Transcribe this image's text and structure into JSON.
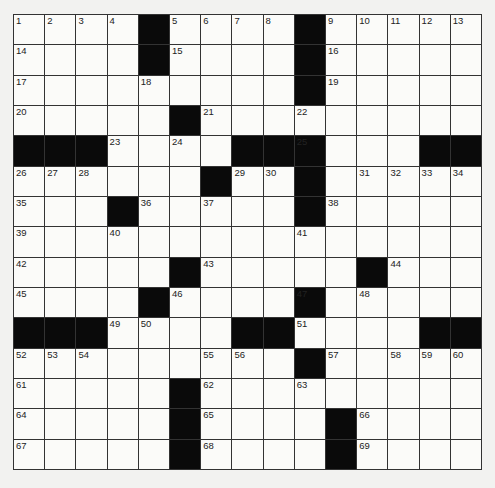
{
  "puzzle": {
    "rows": 15,
    "cols": 15,
    "colors": {
      "block": "#0a0a0a",
      "cell": "#fbfbf9",
      "line": "#333333"
    },
    "grid": [
      "....#....#.....",
      "....#....#.....",
      ".........#.....",
      ".....#.........",
      "###....###...##",
      "......#..#.....",
      "...#.....#.....",
      "...............",
      ".....#.....#...",
      "....#....#.....",
      "###....##....##",
      ".........#.....",
      ".....#.........",
      ".....#....#....",
      ".....#....#...."
    ],
    "numbers": [
      {
        "r": 0,
        "c": 0,
        "n": 1
      },
      {
        "r": 0,
        "c": 1,
        "n": 2
      },
      {
        "r": 0,
        "c": 2,
        "n": 3
      },
      {
        "r": 0,
        "c": 3,
        "n": 4
      },
      {
        "r": 0,
        "c": 5,
        "n": 5
      },
      {
        "r": 0,
        "c": 6,
        "n": 6
      },
      {
        "r": 0,
        "c": 7,
        "n": 7
      },
      {
        "r": 0,
        "c": 8,
        "n": 8
      },
      {
        "r": 0,
        "c": 10,
        "n": 9
      },
      {
        "r": 0,
        "c": 11,
        "n": 10
      },
      {
        "r": 0,
        "c": 12,
        "n": 11
      },
      {
        "r": 0,
        "c": 13,
        "n": 12
      },
      {
        "r": 0,
        "c": 14,
        "n": 13
      },
      {
        "r": 1,
        "c": 0,
        "n": 14
      },
      {
        "r": 1,
        "c": 5,
        "n": 15
      },
      {
        "r": 1,
        "c": 10,
        "n": 16
      },
      {
        "r": 2,
        "c": 0,
        "n": 17
      },
      {
        "r": 2,
        "c": 4,
        "n": 18
      },
      {
        "r": 2,
        "c": 10,
        "n": 19
      },
      {
        "r": 3,
        "c": 0,
        "n": 20
      },
      {
        "r": 3,
        "c": 6,
        "n": 21
      },
      {
        "r": 3,
        "c": 9,
        "n": 22
      },
      {
        "r": 4,
        "c": 3,
        "n": 23
      },
      {
        "r": 4,
        "c": 5,
        "n": 24
      },
      {
        "r": 4,
        "c": 9,
        "n": 25
      },
      {
        "r": 5,
        "c": 0,
        "n": 26
      },
      {
        "r": 5,
        "c": 1,
        "n": 27
      },
      {
        "r": 5,
        "c": 2,
        "n": 28
      },
      {
        "r": 5,
        "c": 7,
        "n": 29
      },
      {
        "r": 5,
        "c": 8,
        "n": 30
      },
      {
        "r": 5,
        "c": 11,
        "n": 31
      },
      {
        "r": 5,
        "c": 12,
        "n": 32
      },
      {
        "r": 5,
        "c": 13,
        "n": 33
      },
      {
        "r": 5,
        "c": 14,
        "n": 34
      },
      {
        "r": 6,
        "c": 0,
        "n": 35
      },
      {
        "r": 6,
        "c": 4,
        "n": 36
      },
      {
        "r": 6,
        "c": 6,
        "n": 37
      },
      {
        "r": 6,
        "c": 10,
        "n": 38
      },
      {
        "r": 7,
        "c": 0,
        "n": 39
      },
      {
        "r": 7,
        "c": 3,
        "n": 40
      },
      {
        "r": 7,
        "c": 9,
        "n": 41
      },
      {
        "r": 8,
        "c": 0,
        "n": 42
      },
      {
        "r": 8,
        "c": 6,
        "n": 43
      },
      {
        "r": 8,
        "c": 12,
        "n": 44
      },
      {
        "r": 9,
        "c": 0,
        "n": 45
      },
      {
        "r": 9,
        "c": 5,
        "n": 46
      },
      {
        "r": 9,
        "c": 9,
        "n": 47
      },
      {
        "r": 9,
        "c": 11,
        "n": 48
      },
      {
        "r": 10,
        "c": 3,
        "n": 49
      },
      {
        "r": 10,
        "c": 4,
        "n": 50
      },
      {
        "r": 10,
        "c": 9,
        "n": 51
      },
      {
        "r": 11,
        "c": 0,
        "n": 52
      },
      {
        "r": 11,
        "c": 1,
        "n": 53
      },
      {
        "r": 11,
        "c": 2,
        "n": 54
      },
      {
        "r": 11,
        "c": 6,
        "n": 55
      },
      {
        "r": 11,
        "c": 7,
        "n": 56
      },
      {
        "r": 11,
        "c": 10,
        "n": 57
      },
      {
        "r": 11,
        "c": 12,
        "n": 58
      },
      {
        "r": 11,
        "c": 13,
        "n": 59
      },
      {
        "r": 11,
        "c": 14,
        "n": 60
      },
      {
        "r": 12,
        "c": 0,
        "n": 61
      },
      {
        "r": 12,
        "c": 6,
        "n": 62
      },
      {
        "r": 12,
        "c": 9,
        "n": 63
      },
      {
        "r": 13,
        "c": 0,
        "n": 64
      },
      {
        "r": 13,
        "c": 6,
        "n": 65
      },
      {
        "r": 13,
        "c": 11,
        "n": 66
      },
      {
        "r": 14,
        "c": 0,
        "n": 67
      },
      {
        "r": 14,
        "c": 6,
        "n": 68
      },
      {
        "r": 14,
        "c": 11,
        "n": 69
      }
    ]
  }
}
